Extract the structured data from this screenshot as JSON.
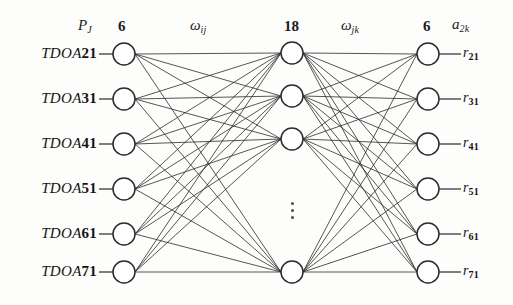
{
  "figure": {
    "type": "neural-network-diagram",
    "title": "",
    "background_color": "#fdfdfc",
    "stroke_color": "#2b2b2b"
  },
  "headers": {
    "input_symbol": "P",
    "input_symbol_sub": "J",
    "input_count": "6",
    "weights_1": "ω",
    "weights_1_sub": "ij",
    "hidden_count": "18",
    "weights_2": "ω",
    "weights_2_sub": "jk",
    "output_count": "6",
    "output_symbol": "a",
    "output_symbol_sub": "2k"
  },
  "layers": {
    "input": {
      "name": "input-layer",
      "node_count": 6,
      "displayed_nodes": 6,
      "labels": [
        {
          "prefix": "TDOA",
          "number": "21"
        },
        {
          "prefix": "TDOA",
          "number": "31"
        },
        {
          "prefix": "TDOA",
          "number": "41"
        },
        {
          "prefix": "TDOA",
          "number": "51"
        },
        {
          "prefix": "TDOA",
          "number": "61"
        },
        {
          "prefix": "TDOA",
          "number": "71"
        }
      ]
    },
    "hidden": {
      "name": "hidden-layer",
      "node_count": 18,
      "displayed_nodes": 4,
      "ellipsis": "⋮"
    },
    "output": {
      "name": "output-layer",
      "node_count": 6,
      "displayed_nodes": 6,
      "labels": [
        {
          "base": "r",
          "sub": "21"
        },
        {
          "base": "r",
          "sub": "31"
        },
        {
          "base": "r",
          "sub": "41"
        },
        {
          "base": "r",
          "sub": "51"
        },
        {
          "base": "r",
          "sub": "61"
        },
        {
          "base": "r",
          "sub": "71"
        }
      ]
    }
  },
  "geometry": {
    "input_x": 124,
    "hidden_x": 292,
    "output_x": 428,
    "node_radius": 11,
    "input_ys": [
      54,
      99,
      144,
      189,
      234,
      272
    ],
    "hidden_ys": [
      53,
      96,
      139,
      272
    ],
    "output_ys": [
      54,
      99,
      144,
      189,
      234,
      272
    ]
  }
}
